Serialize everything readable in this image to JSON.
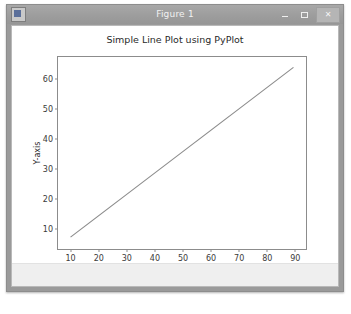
{
  "window": {
    "title": "Figure 1",
    "app_icon": "matplotlib-icon",
    "controls": {
      "minimize": "—",
      "maximize": "❐",
      "close": "✕"
    },
    "statusbar_text": ""
  },
  "chart_data": {
    "type": "line",
    "title": "Simple Line Plot using PyPlot",
    "xlabel": "X-axis",
    "ylabel": "Y-axis",
    "grid": false,
    "legend": null,
    "xlim": [
      5.5,
      94.5
    ],
    "ylim": [
      2.5,
      67.5
    ],
    "xticks": [
      10,
      20,
      30,
      40,
      50,
      60,
      70,
      80,
      90
    ],
    "yticks": [
      10,
      20,
      30,
      40,
      50,
      60
    ],
    "line_color": "#8a8a8a",
    "series": [
      {
        "name": "line",
        "x": [
          10,
          90
        ],
        "y": [
          6.5,
          64
        ]
      }
    ]
  }
}
